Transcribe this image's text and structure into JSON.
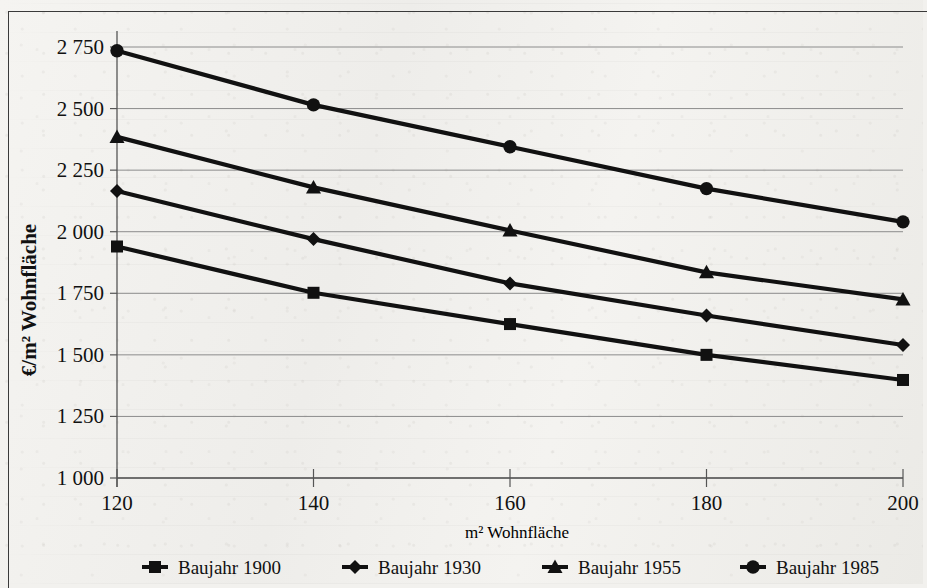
{
  "chart_data": {
    "type": "line",
    "title": "",
    "xlabel": "m² Wohnfläche",
    "ylabel": "€/m² Wohnfläche",
    "x": [
      120,
      140,
      160,
      180,
      200
    ],
    "xticklabels": [
      "120",
      "140",
      "160",
      "180",
      "200"
    ],
    "xlim": [
      120,
      200
    ],
    "ylim": [
      1000,
      2750
    ],
    "yticks": [
      1000,
      1250,
      1500,
      1750,
      2000,
      2250,
      2500,
      2750
    ],
    "yticklabels": [
      "1 000",
      "1 250",
      "1 500",
      "1 750",
      "2 000",
      "2 250",
      "2 500",
      "2 750"
    ],
    "grid": "horizontal",
    "legend_position": "bottom",
    "series": [
      {
        "name": "Baujahr 1900",
        "marker": "square",
        "values": [
          1940,
          1752,
          1625,
          1500,
          1398
        ]
      },
      {
        "name": "Baujahr 1930",
        "marker": "diamond",
        "values": [
          2165,
          1970,
          1790,
          1660,
          1540
        ]
      },
      {
        "name": "Baujahr 1955",
        "marker": "triangle",
        "values": [
          2385,
          2180,
          2005,
          1835,
          1725
        ]
      },
      {
        "name": "Baujahr 1985",
        "marker": "circle",
        "values": [
          2735,
          2515,
          2345,
          2175,
          2040
        ]
      }
    ]
  },
  "colors": {
    "ink": "#111111",
    "grid": "#8c8c8c",
    "axis": "#555555",
    "frame": "#3a3a3a",
    "paper": "#f2f1ee"
  },
  "axis_titles": {
    "x": "m² Wohnfläche",
    "y": "€/m² Wohnfläche"
  }
}
